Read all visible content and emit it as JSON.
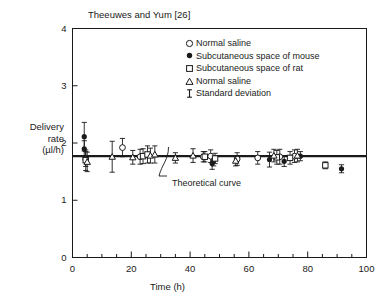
{
  "figure": {
    "title": "Theeuwes and Yum [26]",
    "annotation": "Theoretical curve",
    "ylabel_lines": [
      "Delivery",
      "rate",
      "(µl/h)"
    ],
    "xlabel": "Time (h)"
  },
  "legend": {
    "items": [
      {
        "marker": "open-circle",
        "label": "Normal saline"
      },
      {
        "marker": "filled-circle",
        "label": "Subcutaneous space of mouse"
      },
      {
        "marker": "open-square",
        "label": "Subcutaneous space of rat"
      },
      {
        "marker": "open-triangle",
        "label": "Normal saline"
      },
      {
        "marker": "error-bar",
        "label": "Standard deviation"
      }
    ]
  },
  "chart_data": {
    "type": "scatter",
    "title": "Theeuwes and Yum [26]",
    "xlabel": "Time (h)",
    "ylabel": "Delivery rate (µl/h)",
    "xlim": [
      0,
      100
    ],
    "ylim": [
      0,
      4
    ],
    "xticks": [
      0,
      20,
      40,
      60,
      80,
      100
    ],
    "yticks": [
      0,
      1,
      2,
      3,
      4
    ],
    "xminor_step": 5,
    "grid": false,
    "legend_position": "upper-center",
    "theoretical_curve": {
      "label": "Theoretical curve",
      "type": "horizontal-line",
      "y": 1.77
    },
    "series": [
      {
        "name": "Subcutaneous space of mouse",
        "marker": "filled-circle",
        "points": [
          {
            "x": 4.0,
            "y": 2.11,
            "err": 0.25
          },
          {
            "x": 4.0,
            "y": 1.9,
            "err": 0.14
          },
          {
            "x": 47.5,
            "y": 1.64,
            "err": 0.1
          },
          {
            "x": 48.0,
            "y": 1.69,
            "err": 0.09
          },
          {
            "x": 67.0,
            "y": 1.71,
            "err": 0.13
          },
          {
            "x": 72.0,
            "y": 1.68,
            "err": 0.09
          },
          {
            "x": 77.5,
            "y": 1.77,
            "err": 0.08
          },
          {
            "x": 91.5,
            "y": 1.55,
            "err": 0.07
          }
        ]
      },
      {
        "name": "Normal saline (circle)",
        "marker": "open-circle",
        "points": [
          {
            "x": 4.5,
            "y": 1.72,
            "err": 0.13
          },
          {
            "x": 17.0,
            "y": 1.92,
            "err": 0.16
          },
          {
            "x": 23.0,
            "y": 1.76,
            "err": 0.13
          },
          {
            "x": 44.5,
            "y": 1.76,
            "err": 0.09
          },
          {
            "x": 47.0,
            "y": 1.77,
            "err": 0.11
          },
          {
            "x": 56.0,
            "y": 1.72,
            "err": 0.11
          },
          {
            "x": 63.0,
            "y": 1.74,
            "err": 0.11
          },
          {
            "x": 70.5,
            "y": 1.76,
            "err": 0.13
          },
          {
            "x": 75.5,
            "y": 1.77,
            "err": 0.11
          }
        ]
      },
      {
        "name": "Subcutaneous space of rat",
        "marker": "open-square",
        "points": [
          {
            "x": 4.5,
            "y": 1.7,
            "err": 0.18
          },
          {
            "x": 24.0,
            "y": 1.77,
            "err": 0.13
          },
          {
            "x": 25.5,
            "y": 1.8,
            "err": 0.15
          },
          {
            "x": 45.0,
            "y": 1.76,
            "err": 0.09
          },
          {
            "x": 48.5,
            "y": 1.73,
            "err": 0.09
          },
          {
            "x": 69.5,
            "y": 1.75,
            "err": 0.12
          },
          {
            "x": 74.0,
            "y": 1.74,
            "err": 0.11
          },
          {
            "x": 86.0,
            "y": 1.61,
            "err": 0.06
          }
        ]
      },
      {
        "name": "Normal saline (triangle)",
        "marker": "open-triangle",
        "points": [
          {
            "x": 5.0,
            "y": 1.67,
            "err": 0.17
          },
          {
            "x": 13.5,
            "y": 1.76,
            "err": 0.27
          },
          {
            "x": 20.5,
            "y": 1.75,
            "err": 0.12
          },
          {
            "x": 26.5,
            "y": 1.78,
            "err": 0.13
          },
          {
            "x": 28.0,
            "y": 1.8,
            "err": 0.15
          },
          {
            "x": 35.0,
            "y": 1.74,
            "err": 0.09
          },
          {
            "x": 41.0,
            "y": 1.78,
            "err": 0.12
          },
          {
            "x": 55.5,
            "y": 1.69,
            "err": 0.09
          },
          {
            "x": 68.5,
            "y": 1.78,
            "err": 0.11
          },
          {
            "x": 76.5,
            "y": 1.78,
            "err": 0.11
          }
        ]
      }
    ]
  }
}
